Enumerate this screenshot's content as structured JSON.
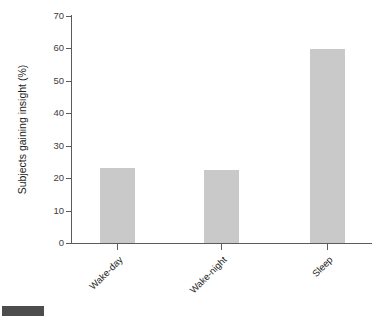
{
  "chart_data": {
    "type": "bar",
    "title": "",
    "subtitle": "",
    "categories": [
      "Wake-day",
      "Wake-night",
      "Sleep"
    ],
    "values": [
      23,
      22.5,
      59.8
    ],
    "xlabel": "",
    "ylabel": "Subjects gaining insight (%)",
    "ylim": [
      0,
      70
    ],
    "yticks": [
      0,
      10,
      20,
      30,
      40,
      50,
      60,
      70
    ],
    "ytick_labels": [
      "0",
      "10",
      "20",
      "30",
      "40",
      "50",
      "60",
      "70"
    ],
    "grid": false,
    "legend": null,
    "bar_color": "#c9c9c9",
    "axis_color": "#5b5b5b",
    "text_color": "#1d1d1d",
    "xtick_label_rotation": -45,
    "series": [
      {
        "name": "Subjects gaining insight (%)",
        "values": [
          23,
          22.5,
          59.8
        ]
      }
    ]
  },
  "caption": {
    "badge_label": "",
    "text": ""
  }
}
